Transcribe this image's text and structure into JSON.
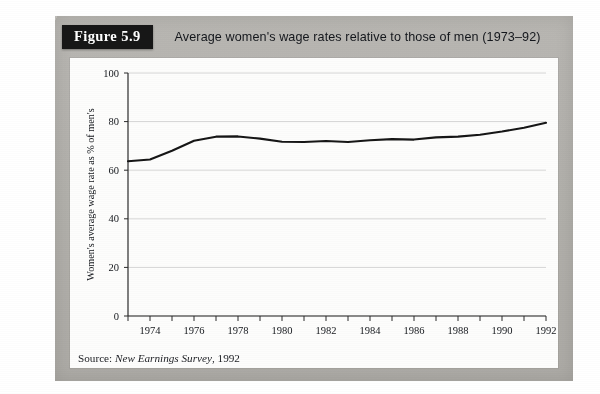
{
  "figure": {
    "badge_label": "Figure 5.9",
    "title": "Average women's wage rates relative to those of men (1973–92)",
    "source_prefix": "Source:",
    "source_title": "New Earnings Survey",
    "source_suffix": ", 1992"
  },
  "chart_data": {
    "type": "line",
    "title": "Average women's wage rates relative to those of men (1973–92)",
    "xlabel": "",
    "ylabel": "Women's average wage rate as % of men's",
    "xlim": [
      1973,
      1992
    ],
    "ylim": [
      0,
      100
    ],
    "grid": true,
    "legend": null,
    "y_ticks": [
      0,
      20,
      40,
      60,
      80,
      100
    ],
    "y_tick_labels": [
      "0",
      "20",
      "40",
      "60",
      "80",
      "100"
    ],
    "x_ticks": [
      1973,
      1974,
      1975,
      1976,
      1977,
      1978,
      1979,
      1980,
      1981,
      1982,
      1983,
      1984,
      1985,
      1986,
      1987,
      1988,
      1989,
      1990,
      1991,
      1992
    ],
    "x_tick_labels": [
      "",
      "1974",
      "",
      "1976",
      "",
      "1978",
      "",
      "1980",
      "",
      "1982",
      "",
      "1984",
      "",
      "1986",
      "",
      "1988",
      "",
      "1990",
      "",
      "1992"
    ],
    "x": [
      1973,
      1974,
      1975,
      1976,
      1977,
      1978,
      1979,
      1980,
      1981,
      1982,
      1983,
      1984,
      1985,
      1986,
      1987,
      1988,
      1989,
      1990,
      1991,
      1992
    ],
    "values": [
      63.7,
      64.4,
      68.0,
      72.1,
      73.8,
      73.9,
      73.0,
      71.7,
      71.6,
      72.0,
      71.6,
      72.3,
      72.8,
      72.6,
      73.5,
      73.8,
      74.6,
      75.9,
      77.5,
      79.5
    ],
    "series": [
      {
        "name": "Women's average wage rate as % of men's",
        "values": [
          63.7,
          64.4,
          68.0,
          72.1,
          73.8,
          73.9,
          73.0,
          71.7,
          71.6,
          72.0,
          71.6,
          72.3,
          72.8,
          72.6,
          73.5,
          73.8,
          74.6,
          75.9,
          77.5,
          79.5
        ],
        "color": "#161616"
      }
    ]
  },
  "colors": {
    "board": "#b9b7b2",
    "panel": "#fdfdfc",
    "line": "#161616",
    "grid": "#d7d7d7",
    "badge_bg": "#171717",
    "badge_fg": "#ffffff"
  }
}
